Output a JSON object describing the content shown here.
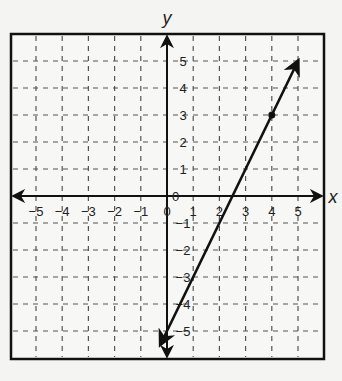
{
  "chart_data": {
    "type": "line",
    "title": "",
    "xlabel": "x",
    "ylabel": "y",
    "xlim": [
      -6,
      6
    ],
    "ylim": [
      -6,
      6
    ],
    "grid": true,
    "grid_style": "dashed",
    "x_ticks": [
      -5,
      -4,
      -3,
      -2,
      -1,
      0,
      1,
      2,
      3,
      4,
      5
    ],
    "y_ticks": [
      -5,
      -4,
      -3,
      -2,
      -1,
      0,
      1,
      2,
      3,
      4,
      5
    ],
    "x_tick_labels": [
      "-5",
      "-4",
      "-3",
      "-2",
      "-1",
      "0",
      "1",
      "2",
      "3",
      "4",
      "5"
    ],
    "y_tick_labels": [
      "-5",
      "-4",
      "-3",
      "-2",
      "-1",
      "0",
      "1",
      "2",
      "3",
      "4",
      "5"
    ],
    "series": [
      {
        "name": "line",
        "equation": "y = 2x - 5",
        "x": [
          -0.25,
          5
        ],
        "y": [
          -5.5,
          5
        ],
        "arrows": "both",
        "color": "#111111"
      }
    ],
    "points": [
      {
        "x": 4,
        "y": 3,
        "marker": "dot"
      }
    ]
  }
}
